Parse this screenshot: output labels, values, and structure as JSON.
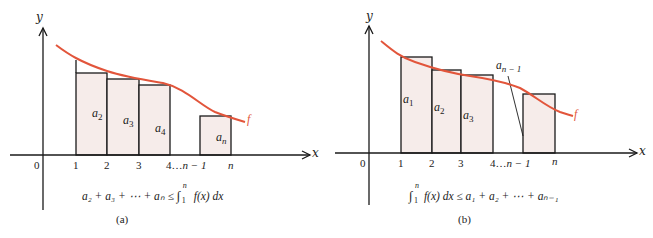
{
  "colors": {
    "curve": "#e2553b",
    "rect_fill": "#f6ecea",
    "rect_stroke": "#1a1a1a",
    "axis": "#1a1a1a",
    "text": "#222222"
  },
  "panel_a": {
    "caption": "(a)",
    "axis_y_label": "y",
    "axis_x_label": "x",
    "origin_label": "0",
    "ticks": [
      "1",
      "2",
      "3",
      "4",
      "n",
      "n"
    ],
    "tick_4_label": "4",
    "ellipsis": "…",
    "tick_nm1_label": "n − 1",
    "tick_n_label": "n",
    "curve_label": "f",
    "rect_labels": {
      "r1": "a",
      "r1_sub": "2",
      "r2": "a",
      "r2_sub": "3",
      "r3": "a",
      "r3_sub": "4",
      "r4": "a",
      "r4_sub": "n"
    },
    "formula": {
      "lhs": "a₂ + a₃ + ⋯ + aₙ ≤ ",
      "integral": "∫",
      "upper": "n",
      "lower": "1",
      "rhs": " f(x) dx"
    }
  },
  "panel_b": {
    "caption": "(b)",
    "axis_y_label": "y",
    "axis_x_label": "x",
    "origin_label": "0",
    "tick_1_label": "1",
    "tick_2_label": "2",
    "tick_3_label": "3",
    "tick_4_label": "4",
    "ellipsis": "…",
    "tick_nm1_label": "n − 1",
    "tick_n_label": "n",
    "curve_label": "f",
    "callout_label": "a",
    "callout_sub": "n − 1",
    "rect_labels": {
      "r1": "a",
      "r1_sub": "1",
      "r2": "a",
      "r2_sub": "2",
      "r3": "a",
      "r3_sub": "3"
    },
    "formula": {
      "integral": "∫",
      "upper": "n",
      "lower": "1",
      "lhs": " f(x) dx ≤ a₁ + a₂ + ⋯ + aₙ₋₁"
    }
  },
  "tick_labels_a": {
    "t1": "1",
    "t2": "2",
    "t3": "3"
  }
}
